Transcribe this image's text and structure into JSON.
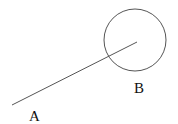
{
  "diagram": {
    "colors": {
      "stroke": "#555555",
      "text": "#111111",
      "background": "#ffffff"
    },
    "segment": {
      "x1": 12,
      "y1": 105,
      "x2": 137,
      "y2": 42
    },
    "circle": {
      "cx": 135,
      "cy": 40,
      "r": 31
    },
    "labels": [
      {
        "id": "A",
        "text": "A",
        "x": 29,
        "y": 121
      },
      {
        "id": "B",
        "text": "B",
        "x": 134,
        "y": 93
      }
    ]
  }
}
